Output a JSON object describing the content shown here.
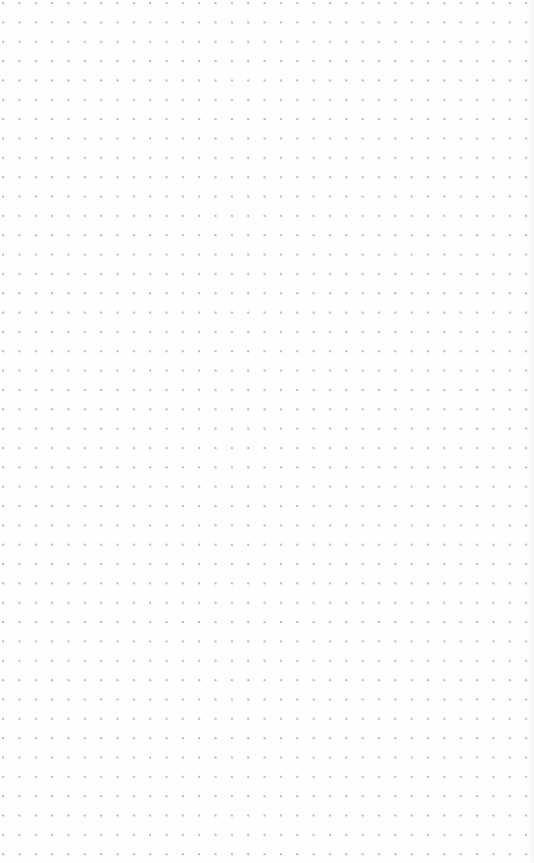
{
  "paper": {
    "type": "dot-grid",
    "dot_color": "#b9b9b9",
    "background_color": "#fefefe",
    "columns": 32,
    "rows": 45,
    "spacing_x_px": 16.35,
    "spacing_y_px": 19.35
  }
}
